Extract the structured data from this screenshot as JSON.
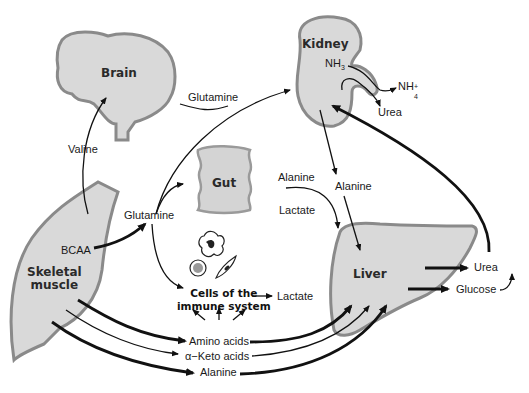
{
  "diagram": {
    "organs": {
      "brain": "Brain",
      "kidney": "Kidney",
      "gut": "Gut",
      "liver": "Liver",
      "skeletal_muscle_line1": "Skeletal",
      "skeletal_muscle_line2": "muscle",
      "immune_line1": "Cells of the",
      "immune_line2": "immune system"
    },
    "labels": {
      "valine": "Valine",
      "glutamine_top": "Glutamine",
      "glutamine_mid": "Glutamine",
      "bcaa": "BCAA",
      "nh3": "NH",
      "nh3_sub": "3",
      "nh4": "NH",
      "nh4_sup": "+",
      "nh4_sub": "4",
      "urea_kidney": "Urea",
      "alanine_gut": "Alanine",
      "lactate_gut": "Lactate",
      "alanine_kidney": "Alanine",
      "lactate_immune": "Lactate",
      "amino_acids": "Amino acids",
      "keto_acids": "α−Keto acids",
      "alanine_bottom": "Alanine",
      "urea_liver": "Urea",
      "glucose": "Glucose"
    },
    "colors": {
      "organ_fill": "#d9d9d9",
      "organ_border": "#8a8a8a",
      "arrow": "#111111"
    }
  }
}
